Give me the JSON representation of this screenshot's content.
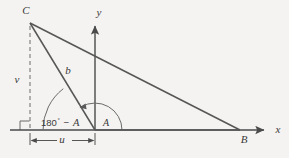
{
  "figure": {
    "kind": "geometry-diagram",
    "background_color": "#f4f3f1",
    "line_color": "#565656",
    "text_color": "#3a3a3a"
  },
  "axes": {
    "x_label": "x",
    "y_label": "y",
    "origin_label": ""
  },
  "vertices": [
    {
      "id": "C",
      "label": "C",
      "x": 30,
      "y": 22
    },
    {
      "id": "B",
      "label": "B",
      "x": 240,
      "y": 130
    },
    {
      "id": "O",
      "label": "",
      "x": 95,
      "y": 130
    }
  ],
  "segments": [
    {
      "id": "side-b",
      "label": "b",
      "from": "C",
      "to": "O"
    },
    {
      "id": "side-CB",
      "label": "",
      "from": "C",
      "to": "B"
    },
    {
      "id": "side-OB",
      "label": "",
      "from": "O",
      "to": "B"
    }
  ],
  "measures": {
    "height_label": "v",
    "base_label": "u",
    "side_label": "b"
  },
  "angles": [
    {
      "id": "exterior",
      "label_number": "180",
      "degree_symbol": "°",
      "label_operator": "−",
      "label_variable": "A",
      "full_label": "180° − A"
    },
    {
      "id": "interior",
      "label": "A"
    }
  ],
  "marks": {
    "right_angle": "right-angle-mark",
    "dashed_drop": "dashed-height-line"
  }
}
